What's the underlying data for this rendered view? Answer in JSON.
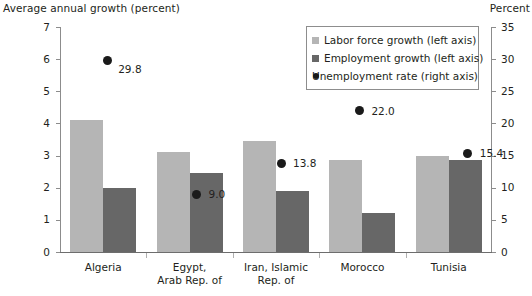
{
  "chart_data": {
    "type": "bar",
    "title": "",
    "left_axis_title": "Average annual growth (percent)",
    "right_axis_title": "Percent",
    "xlabel": "",
    "ylabel": "Average annual growth (percent)",
    "ylim": [
      0,
      7
    ],
    "y2lim": [
      0,
      35
    ],
    "yticks": [
      "0",
      "1",
      "2",
      "3",
      "4",
      "5",
      "6",
      "7"
    ],
    "y2ticks": [
      "0",
      "5",
      "10",
      "15",
      "20",
      "25",
      "30",
      "35"
    ],
    "grid": false,
    "legend_position": "top-right",
    "categories": [
      "Algeria",
      "Egypt,\nArab Rep. of",
      "Iran, Islamic\nRep. of",
      "Morocco",
      "Tunisia"
    ],
    "series": [
      {
        "name": "Labor force  growth (left axis)",
        "type": "bar",
        "axis": "left",
        "color": "#b5b5b5",
        "values": [
          4.1,
          3.1,
          3.45,
          2.85,
          3.0
        ]
      },
      {
        "name": "Employment growth (left axis)",
        "type": "bar",
        "axis": "left",
        "color": "#676767",
        "values": [
          2.0,
          2.45,
          1.9,
          1.2,
          2.85
        ]
      },
      {
        "name": "Unemployment rate (right axis)",
        "type": "scatter",
        "axis": "right",
        "color": "#1a1a1a",
        "values": [
          29.8,
          9.0,
          13.8,
          22.0,
          15.4
        ],
        "data_labels": [
          "29.8",
          "9.0",
          "13.8",
          "22.0",
          "15.4"
        ]
      }
    ]
  },
  "legend": {
    "items": [
      {
        "label": "Labor force  growth (left axis)",
        "marker": "square-light"
      },
      {
        "label": "Employment growth (left axis)",
        "marker": "square-dark"
      },
      {
        "label": "Unemployment rate (right axis)",
        "marker": "circle-black"
      }
    ]
  }
}
